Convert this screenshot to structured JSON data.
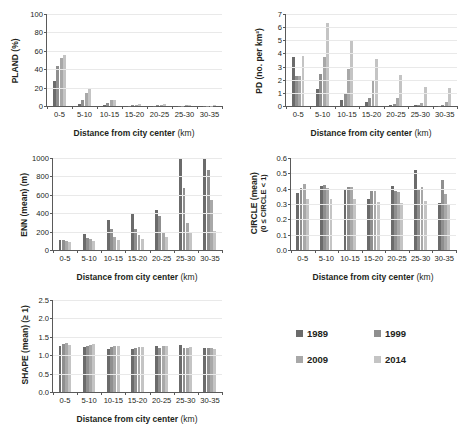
{
  "figure": {
    "series_names": [
      "1989",
      "1999",
      "2009",
      "2014"
    ],
    "series_colors": [
      "#6b6b6b",
      "#8f8f8f",
      "#a8a8a8",
      "#c4c4c4"
    ],
    "categories": [
      "0-5",
      "5-10",
      "10-15",
      "15-20",
      "20-25",
      "25-30",
      "30-35"
    ],
    "xlabel_main": "Distance from city center",
    "xlabel_unit": "(km)"
  },
  "legend": {
    "items": [
      {
        "label": "1989",
        "color": "#6b6b6b"
      },
      {
        "label": "1999",
        "color": "#8f8f8f"
      },
      {
        "label": "2009",
        "color": "#a8a8a8"
      },
      {
        "label": "2014",
        "color": "#c4c4c4"
      }
    ]
  },
  "chart_data": [
    {
      "id": "pland",
      "type": "bar",
      "title": "",
      "ylabel": "PLAND (%)",
      "ylabel_sub": "",
      "xlabel": "Distance from city center (km)",
      "categories": [
        "0-5",
        "5-10",
        "10-15",
        "15-20",
        "20-25",
        "25-30",
        "30-35"
      ],
      "ylim": [
        0,
        100
      ],
      "yticks": [
        0,
        20,
        40,
        60,
        80,
        100
      ],
      "ytick_labels": [
        "0",
        "20",
        "40",
        "60",
        "80",
        "100"
      ],
      "grid": true,
      "legend_position": "none",
      "series": [
        {
          "name": "1989",
          "values": [
            27.0,
            2.0,
            1.2,
            0.3,
            0.5,
            0.2,
            0.1
          ]
        },
        {
          "name": "1999",
          "values": [
            44.0,
            6.5,
            3.0,
            0.6,
            0.8,
            0.4,
            0.2
          ]
        },
        {
          "name": "2009",
          "values": [
            52.0,
            14.5,
            6.0,
            1.3,
            1.5,
            0.8,
            0.4
          ]
        },
        {
          "name": "2014",
          "values": [
            55.0,
            19.5,
            6.8,
            1.8,
            2.2,
            1.2,
            0.6
          ]
        }
      ]
    },
    {
      "id": "pd",
      "type": "bar",
      "title": "",
      "ylabel": "PD (no. per km²)",
      "ylabel_sub": "",
      "xlabel": "Distance from city center (km)",
      "categories": [
        "0-5",
        "5-10",
        "10-15",
        "15-20",
        "20-25",
        "25-30",
        "30-35"
      ],
      "ylim": [
        0,
        7
      ],
      "yticks": [
        0,
        1,
        2,
        3,
        4,
        5,
        6,
        7
      ],
      "ytick_labels": [
        "0",
        "1",
        "2",
        "3",
        "4",
        "5",
        "6",
        "7"
      ],
      "grid": true,
      "legend_position": "none",
      "series": [
        {
          "name": "1989",
          "values": [
            3.75,
            1.3,
            0.42,
            0.28,
            0.1,
            0.05,
            0.02
          ]
        },
        {
          "name": "1999",
          "values": [
            2.3,
            2.45,
            1.02,
            0.6,
            0.18,
            0.1,
            0.05
          ]
        },
        {
          "name": "2009",
          "values": [
            2.28,
            3.72,
            2.85,
            1.88,
            0.62,
            0.2,
            0.28
          ]
        },
        {
          "name": "2014",
          "values": [
            3.78,
            6.28,
            5.02,
            3.55,
            1.15,
            0.5,
            0.05
          ]
        }
      ],
      "extra_bars": {
        "note": "fourth cluster in 20-25 and 25-30 ends with taller 2014 value",
        "values_2014_tail": [
          2.38,
          1.42,
          1.38
        ]
      }
    },
    {
      "id": "enn",
      "type": "bar",
      "title": "",
      "ylabel": "ENN (mean) (m)",
      "ylabel_sub": "",
      "xlabel": "Distance from city center (km)",
      "categories": [
        "0-5",
        "5-10",
        "10-15",
        "15-20",
        "20-25",
        "25-30",
        "30-35"
      ],
      "ylim": [
        0,
        1000
      ],
      "yticks": [
        0,
        200,
        400,
        600,
        800,
        1000
      ],
      "ytick_labels": [
        "0",
        "200",
        "400",
        "600",
        "800",
        "1000"
      ],
      "grid": true,
      "legend_position": "none",
      "series": [
        {
          "name": "1989",
          "values": [
            110,
            172,
            330,
            405,
            440,
            1000,
            1000
          ]
        },
        {
          "name": "1999",
          "values": [
            105,
            130,
            228,
            232,
            368,
            675,
            870
          ]
        },
        {
          "name": "2009",
          "values": [
            98,
            118,
            138,
            160,
            198,
            290,
            540
          ]
        },
        {
          "name": "2014",
          "values": [
            82,
            98,
            105,
            122,
            138,
            180,
            205
          ]
        }
      ]
    },
    {
      "id": "circle",
      "type": "bar",
      "title": "",
      "ylabel": "CIRCLE (mean)",
      "ylabel_sub": "(0 ≤ CIRCLE < 1)",
      "xlabel": "Distance from city center (km)",
      "categories": [
        "0-5",
        "5-10",
        "10-15",
        "15-20",
        "20-25",
        "25-30",
        "30-35"
      ],
      "ylim": [
        0,
        0.6
      ],
      "yticks": [
        0,
        0.1,
        0.2,
        0.3,
        0.4,
        0.5,
        0.6
      ],
      "ytick_labels": [
        "0.0",
        "0.1",
        "0.2",
        "0.3",
        "0.4",
        "0.5",
        "0.6"
      ],
      "grid": true,
      "legend_position": "none",
      "series": [
        {
          "name": "1989",
          "values": [
            0.375,
            0.418,
            0.4,
            0.33,
            0.418,
            0.52,
            0.305
          ]
        },
        {
          "name": "1999",
          "values": [
            0.405,
            0.422,
            0.412,
            0.385,
            0.388,
            0.395,
            0.455
          ]
        },
        {
          "name": "2009",
          "values": [
            0.432,
            0.405,
            0.412,
            0.388,
            0.378,
            0.41,
            0.368
          ]
        },
        {
          "name": "2014",
          "values": [
            0.335,
            0.335,
            0.33,
            0.312,
            0.305,
            0.32,
            0.3
          ]
        }
      ]
    },
    {
      "id": "shape",
      "type": "bar",
      "title": "",
      "ylabel": "SHAPE (mean) (≥ 1)",
      "ylabel_sub": "",
      "xlabel": "Distance from city center (km)",
      "categories": [
        "0-5",
        "5-10",
        "10-15",
        "15-20",
        "20-25",
        "25-30",
        "30-35"
      ],
      "ylim": [
        0,
        2.5
      ],
      "yticks": [
        0,
        0.5,
        1.0,
        1.5,
        2.0,
        2.5
      ],
      "ytick_labels": [
        "0.0",
        "0.5",
        "1.0",
        "1.5",
        "2.0",
        "2.5"
      ],
      "grid": true,
      "legend_position": "none",
      "series": [
        {
          "name": "1989",
          "values": [
            1.255,
            1.235,
            1.175,
            1.175,
            1.242,
            1.285,
            1.198
          ]
        },
        {
          "name": "1999",
          "values": [
            1.318,
            1.252,
            1.222,
            1.198,
            1.202,
            1.198,
            1.205
          ]
        },
        {
          "name": "2009",
          "values": [
            1.338,
            1.285,
            1.262,
            1.228,
            1.242,
            1.205,
            1.198
          ]
        },
        {
          "name": "2014",
          "values": [
            1.272,
            1.302,
            1.258,
            1.228,
            1.245,
            1.215,
            1.168
          ]
        }
      ]
    }
  ]
}
